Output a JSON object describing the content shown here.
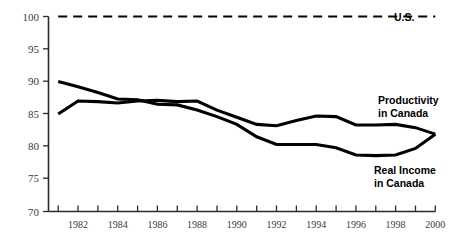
{
  "chart_data": {
    "type": "line",
    "title": "",
    "subtitle": "",
    "xlabel": "",
    "ylabel": "",
    "xlim": [
      1980.6,
      2000
    ],
    "ylim": [
      70,
      100
    ],
    "grid": false,
    "legend_position": "inline-right",
    "y_ticks": [
      70,
      75,
      80,
      85,
      90,
      95,
      100
    ],
    "y_tick_labels": [
      "70",
      "75",
      "80",
      "85",
      "90",
      "95",
      "100"
    ],
    "x_ticks": [
      1981,
      1982,
      1983,
      1984,
      1985,
      1986,
      1987,
      1988,
      1989,
      1990,
      1991,
      1992,
      1993,
      1994,
      1995,
      1996,
      1997,
      1998,
      1999,
      2000
    ],
    "x_tick_labels": [
      "",
      "1982",
      "",
      "1984",
      "",
      "1986",
      "",
      "1988",
      "",
      "1990",
      "",
      "1992",
      "",
      "1994",
      "",
      "1996",
      "",
      "1998",
      "",
      "2000"
    ],
    "x": [
      1981,
      1982,
      1983,
      1984,
      1985,
      1986,
      1987,
      1988,
      1989,
      1990,
      1991,
      1992,
      1993,
      1994,
      1995,
      1996,
      1997,
      1998,
      1999,
      2000
    ],
    "series": [
      {
        "name": "U.S.",
        "label": "U.S.",
        "style": "dashed",
        "values": [
          100,
          100,
          100,
          100,
          100,
          100,
          100,
          100,
          100,
          100,
          100,
          100,
          100,
          100,
          100,
          100,
          100,
          100,
          100,
          100
        ]
      },
      {
        "name": "Productivity in Canada",
        "label": "Productivity\nin Canada",
        "label_line1": "Productivity",
        "label_line2": "in Canada",
        "style": "solid",
        "values": [
          85.0,
          87.0,
          86.9,
          86.7,
          87.0,
          87.1,
          86.9,
          87.0,
          85.6,
          84.5,
          83.4,
          83.2,
          84.0,
          84.7,
          84.6,
          83.3,
          83.3,
          83.4,
          82.9,
          81.9
        ]
      },
      {
        "name": "Real Income in Canada",
        "label": "Real Income\nin Canada",
        "label_line1": "Real Income",
        "label_line2": "in Canada",
        "style": "solid",
        "values": [
          90.0,
          89.2,
          88.3,
          87.3,
          87.2,
          86.5,
          86.4,
          85.6,
          84.6,
          83.4,
          81.5,
          80.3,
          80.3,
          80.3,
          79.8,
          78.7,
          78.6,
          78.7,
          79.7,
          81.9
        ]
      }
    ]
  },
  "labels": {
    "us": "U.S.",
    "productivity_line1": "Productivity",
    "productivity_line2": "in Canada",
    "real_income_line1": "Real Income",
    "real_income_line2": "in Canada"
  },
  "axis": {
    "y_100": "100",
    "y_95": "95",
    "y_90": "90",
    "y_85": "85",
    "y_80": "80",
    "y_75": "75",
    "y_70": "70",
    "x_1982": "1982",
    "x_1984": "1984",
    "x_1986": "1986",
    "x_1988": "1988",
    "x_1990": "1990",
    "x_1992": "1992",
    "x_1994": "1994",
    "x_1996": "1996",
    "x_1998": "1998",
    "x_2000": "2000"
  },
  "colors": {
    "line": "#000000",
    "axis": "#2b2b2b",
    "tick_text": "#3a3a3a",
    "background": "#ffffff"
  }
}
